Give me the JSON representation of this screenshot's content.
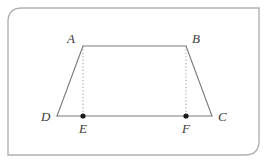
{
  "figure": {
    "kind": "geometry-diagram",
    "frame": {
      "stroke_color": "#b0b0b0",
      "stroke_width": 1.4,
      "corner_radius_px": 14,
      "rounded_corners": [
        "top-left",
        "bottom-right"
      ],
      "square_corners": [
        "top-right",
        "bottom-left"
      ],
      "x": 8,
      "y": 8,
      "width": 251,
      "height": 147
    },
    "style": {
      "solid_line_color": "#7a7a7a",
      "dotted_line_color": "#9a9a9a",
      "dot_fill_color": "#1a1a1a",
      "label_color": "#3b3b3b",
      "solid_line_width": 1.1,
      "dotted_line_width": 1.0,
      "dot_radius": 2.6
    },
    "points": [
      {
        "id": "A",
        "label": "A",
        "x": 83,
        "y": 46,
        "marked": false,
        "label_dx": -16,
        "label_dy": -14
      },
      {
        "id": "B",
        "label": "B",
        "x": 186,
        "y": 46,
        "marked": false,
        "label_dx": 6,
        "label_dy": -14
      },
      {
        "id": "C",
        "label": "C",
        "x": 212,
        "y": 116,
        "marked": false,
        "label_dx": 6,
        "label_dy": -6
      },
      {
        "id": "D",
        "label": "D",
        "x": 57,
        "y": 116,
        "marked": false,
        "label_dx": -16,
        "label_dy": -6
      },
      {
        "id": "E",
        "label": "E",
        "x": 83,
        "y": 116,
        "marked": true,
        "label_dx": -4,
        "label_dy": 6
      },
      {
        "id": "F",
        "label": "F",
        "x": 186,
        "y": 116,
        "marked": true,
        "label_dx": -4,
        "label_dy": 6
      }
    ],
    "solid_segments": [
      {
        "id": "AB",
        "from": "A",
        "to": "B"
      },
      {
        "id": "BC",
        "from": "B",
        "to": "C"
      },
      {
        "id": "DC",
        "from": "D",
        "to": "C"
      },
      {
        "id": "DA",
        "from": "D",
        "to": "A"
      }
    ],
    "dotted_segments": [
      {
        "id": "AE",
        "from": "A",
        "to": "E"
      },
      {
        "id": "BF",
        "from": "B",
        "to": "F"
      }
    ]
  }
}
